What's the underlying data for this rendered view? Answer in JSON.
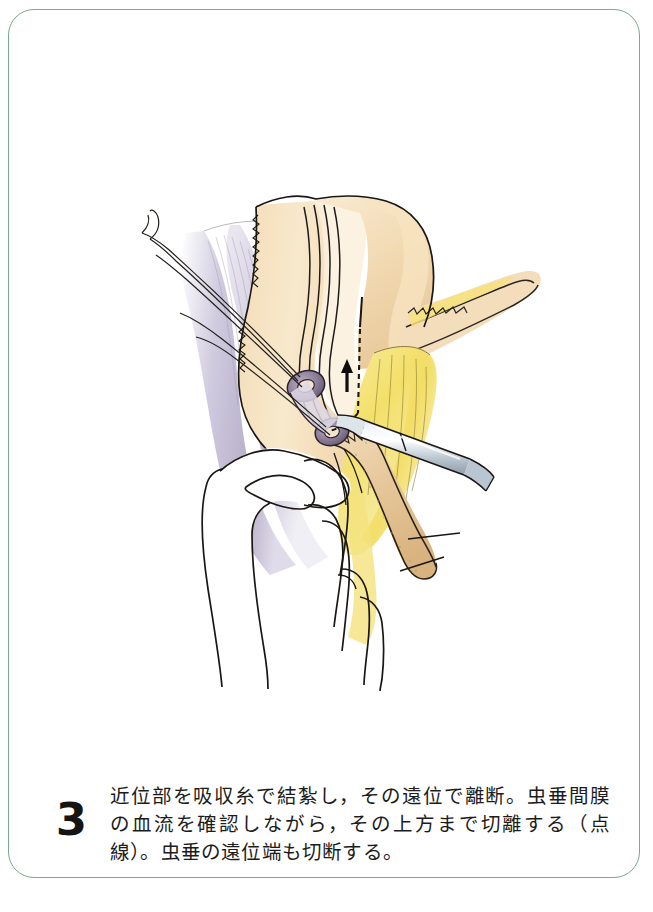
{
  "page": {
    "width": 653,
    "height": 912,
    "background_color": "#ffffff",
    "frame_color": "#7ea88a"
  },
  "caption": {
    "step_number": "3",
    "text": "近位部を吸収糸で結紮し，その遠位で離断。虫垂間膜の血流を確認しながら，その上方まで切離する（点線）。虫垂の遠位端も切断する。"
  },
  "figure": {
    "title": "",
    "kind": "surgical-line-illustration",
    "palette": {
      "ink": "#1a1a1a",
      "ink_soft": "#3a3a3a",
      "cecum_tan": "#f0d3a8",
      "cecum_tan_light": "#f7e6c9",
      "taenia_cream": "#f6e7c4",
      "mesoappendix_yellow": "#f4e06a",
      "mesoappendix_yellow_light": "#f8ecae",
      "appendix_tan": "#e8c79a",
      "mesentery_mauve": "#b6b0c8",
      "mesentery_mauve_light": "#d6d2e2",
      "ligature_ring": "#8a7c93",
      "ligature_ring_dark": "#5d5068",
      "instrument_steel": "#c9d2da",
      "instrument_steel_dark": "#97a4b0",
      "hand_white": "#ffffff"
    },
    "elements": [
      {
        "name": "cecum",
        "label": "盲腸"
      },
      {
        "name": "ascending-colon",
        "label": "上行結腸"
      },
      {
        "name": "taenia-coli",
        "label": "結腸ひも"
      },
      {
        "name": "mesentery",
        "label": "腸間膜"
      },
      {
        "name": "mesoappendix",
        "label": "虫垂間膜"
      },
      {
        "name": "appendix",
        "label": "虫垂"
      },
      {
        "name": "proximal-ligature",
        "label": "近位結紮"
      },
      {
        "name": "distal-ligature",
        "label": "遠位結紮"
      },
      {
        "name": "suture-threads",
        "label": "吸収糸"
      },
      {
        "name": "dissecting-instrument",
        "label": "剥離鉗子"
      },
      {
        "name": "surgeon-hand",
        "label": "術者の手"
      },
      {
        "name": "dashed-cut-line",
        "label": "切離線（点線）"
      },
      {
        "name": "direction-arrow",
        "label": "切離方向"
      }
    ]
  }
}
